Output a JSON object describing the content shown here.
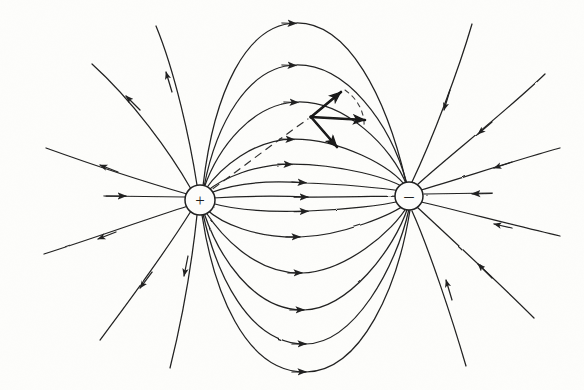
{
  "figure": {
    "background_color": "#fdfdfb",
    "ink_color": "#1c1c1c",
    "width": 584,
    "height": 390
  },
  "charges": [
    {
      "name": "positive-charge",
      "symbol": "+",
      "label": "positive point charge",
      "cx": 200,
      "cy": 200,
      "r": 15
    },
    {
      "name": "negative-charge",
      "symbol": "–",
      "label": "negative point charge",
      "cx": 409,
      "cy": 196,
      "r": 14
    }
  ],
  "vectors": {
    "origin": {
      "x": 311,
      "y": 117
    },
    "items": [
      {
        "name": "vector-component-upper",
        "label": "upper component",
        "dx": 34,
        "dy": -28
      },
      {
        "name": "vector-resultant",
        "label": "resultant field vector",
        "dx": 60,
        "dy": 3
      },
      {
        "name": "vector-component-lower",
        "label": "lower component",
        "dx": 32,
        "dy": 34
      }
    ],
    "dashed_arc": {
      "label": "angle arc between components"
    },
    "dashed_radius": {
      "label": "dashed line to positive charge",
      "from_x": 200,
      "from_y": 200
    }
  },
  "field_lines": {
    "inner_arcs_upper": [
      {
        "apex_y": 22,
        "arrow_x": 296,
        "arrow_y": 24
      },
      {
        "apex_y": 64,
        "arrow_x": 296,
        "arrow_y": 67
      },
      {
        "apex_y": 101,
        "arrow_x": 298,
        "arrow_y": 104
      },
      {
        "apex_y": 137,
        "arrow_x": 294,
        "arrow_y": 141
      },
      {
        "apex_y": 163,
        "arrow_x": 292,
        "arrow_y": 166
      }
    ],
    "inner_lines_middle": [
      {
        "apex_y": 182,
        "arrow_x": 306,
        "arrow_y": 185
      },
      {
        "apex_y": 197,
        "arrow_x": 308,
        "arrow_y": 199
      },
      {
        "apex_y": 212,
        "arrow_x": 308,
        "arrow_y": 212
      }
    ],
    "inner_arcs_lower": [
      {
        "apex_y": 238,
        "arrow_x": 300,
        "arrow_y": 236
      },
      {
        "apex_y": 275,
        "arrow_x": 302,
        "arrow_y": 272
      },
      {
        "apex_y": 312,
        "arrow_x": 304,
        "arrow_y": 308
      },
      {
        "apex_y": 345,
        "arrow_x": 306,
        "arrow_y": 341
      },
      {
        "apex_y": 374,
        "arrow_x": 306,
        "arrow_y": 369
      }
    ],
    "outer_left_count": 5,
    "outer_right_count": 5,
    "axis_left_arrow_direction": "right",
    "axis_right_arrow_direction": "left",
    "arrow_direction_note": "plus to minus"
  }
}
